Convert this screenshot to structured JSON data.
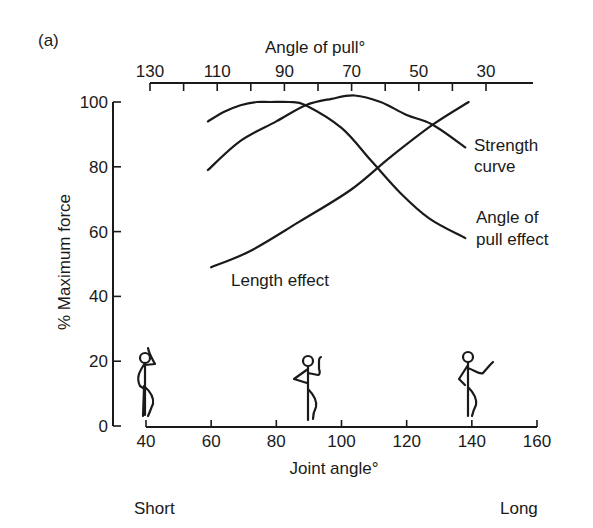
{
  "panel_label": "(a)",
  "chart_data": {
    "type": "line",
    "title": "",
    "panel": "(a)",
    "xlabel": "Joint angle°",
    "ylabel": "% Maximum force",
    "top_xlabel": "Angle of pull°",
    "x_ticks": [
      40,
      60,
      80,
      100,
      120,
      140,
      160
    ],
    "xlim": [
      40,
      160
    ],
    "y_ticks": [
      0,
      20,
      40,
      60,
      80,
      100
    ],
    "ylim": [
      0,
      100
    ],
    "top_x_ticks": [
      130,
      110,
      90,
      70,
      50,
      30
    ],
    "top_x_minor_ticks": [
      130,
      120,
      110,
      100,
      90,
      80,
      70,
      60,
      50,
      40,
      30
    ],
    "x_end_labels": {
      "left": "Short",
      "right": "Long"
    },
    "grid": false,
    "legend": "inline labels",
    "series": [
      {
        "name": "Strength curve",
        "label_lines": [
          "Strength",
          "curve"
        ],
        "x": [
          59,
          69,
          80,
          89,
          97,
          104,
          112,
          120,
          128,
          138
        ],
        "y": [
          79,
          88,
          94,
          99,
          101,
          102,
          100,
          96,
          93,
          86
        ]
      },
      {
        "name": "Angle of pull effect",
        "label_lines": [
          "Angle of",
          "pull effect"
        ],
        "x": [
          59,
          64,
          69,
          74,
          78,
          84,
          89,
          100,
          109,
          118,
          127,
          138
        ],
        "y": [
          94,
          97,
          99,
          100,
          100,
          100,
          99,
          92,
          82,
          72,
          64,
          58
        ]
      },
      {
        "name": "Length effect",
        "label_lines": [
          "Length effect"
        ],
        "x": [
          60,
          72,
          87,
          103,
          115,
          128,
          139
        ],
        "y": [
          49,
          54,
          63,
          73,
          83,
          93,
          100
        ]
      }
    ],
    "annotations": [
      {
        "type": "stick-figure",
        "x": 40,
        "pose": "arm flexed, hand at head (short)"
      },
      {
        "type": "stick-figure",
        "x": 90,
        "pose": "arm at right angle (mid)"
      },
      {
        "type": "stick-figure",
        "x": 140,
        "pose": "arm extended (long)"
      }
    ]
  }
}
